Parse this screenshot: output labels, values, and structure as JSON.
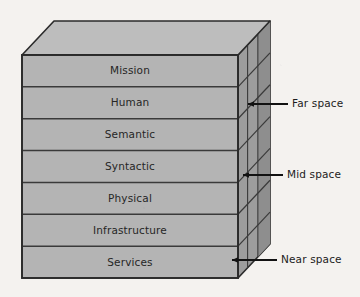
{
  "figure": {
    "type": "layered-3d-block-diagram",
    "background_color": "#f4f2ef"
  },
  "colors": {
    "top_face": "#bdbdbd",
    "front_face": "#b4b4b4",
    "side_face": "#9d9d9d",
    "side_face_dark": "#8e8e8e",
    "outline": "#2b2b2b",
    "layer_divider": "#3a3a3a",
    "text": "#262626",
    "arrow": "#121212"
  },
  "geometry": {
    "front_left_x": 22,
    "front_right_x": 238,
    "front_top_y": 55,
    "front_bottom_y": 278,
    "depth_dx": 32,
    "depth_dy": -34,
    "layer_count": 7,
    "layer_height": 31.857
  },
  "stack": {
    "name": "layer-stack",
    "layers": [
      {
        "id": "mission",
        "label": "Mission"
      },
      {
        "id": "human",
        "label": "Human"
      },
      {
        "id": "semantic",
        "label": "Semantic"
      },
      {
        "id": "syntactic",
        "label": "Syntactic"
      },
      {
        "id": "physical",
        "label": "Physical"
      },
      {
        "id": "infrastructure",
        "label": "Infrastructure"
      },
      {
        "id": "services",
        "label": "Services"
      }
    ]
  },
  "annotations": [
    {
      "id": "far-space",
      "label": "Far space",
      "arrow_tip_x": 248,
      "arrow_tip_y": 104,
      "arrow_tail_x": 288,
      "arrow_tail_y": 104,
      "text_x": 292,
      "text_y": 104
    },
    {
      "id": "mid-space",
      "label": "Mid space",
      "arrow_tip_x": 243,
      "arrow_tip_y": 175,
      "arrow_tail_x": 283,
      "arrow_tail_y": 175,
      "text_x": 287,
      "text_y": 175
    },
    {
      "id": "near-space",
      "label": "Near space",
      "arrow_tip_x": 232,
      "arrow_tip_y": 260,
      "arrow_tail_x": 277,
      "arrow_tail_y": 260,
      "text_x": 281,
      "text_y": 260
    }
  ]
}
